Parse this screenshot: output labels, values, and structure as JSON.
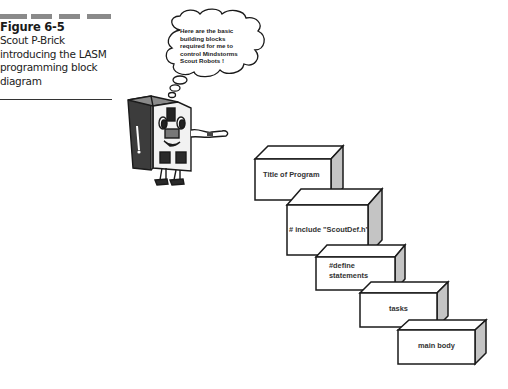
{
  "figure": {
    "label": "Figure 6-5",
    "caption_lines": [
      "Scout P-Brick",
      "introducing the LASM",
      "programming block",
      "diagram"
    ]
  },
  "speech_bubble": {
    "lines": [
      "Here are the basic",
      "building blocks",
      "required for me to",
      "control Mindstorms",
      "Scout Robots !"
    ]
  },
  "character": {
    "name": "Scout P-Brick"
  },
  "blocks": [
    {
      "label": "Title of Program"
    },
    {
      "label": "# include \"ScoutDef.h\""
    },
    {
      "label_lines": [
        "#define",
        "statements"
      ]
    },
    {
      "label": "tasks"
    },
    {
      "label": "main body"
    }
  ],
  "colors": {
    "bar": "#8a8a8a",
    "side_face": "#c4c4c4",
    "outline": "#1a1a1a"
  }
}
